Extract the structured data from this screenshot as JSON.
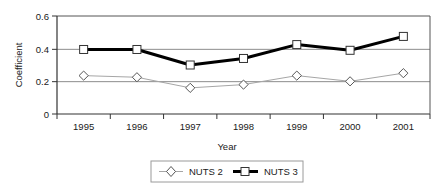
{
  "chart_data": {
    "type": "line",
    "title": "",
    "xlabel": "Year",
    "ylabel": "Coefficient",
    "categories": [
      "1995",
      "1996",
      "1997",
      "1998",
      "1999",
      "2000",
      "2001"
    ],
    "series": [
      {
        "name": "NUTS 2",
        "values": [
          0.235,
          0.225,
          0.16,
          0.18,
          0.235,
          0.2,
          0.25
        ],
        "color": "#a6a6a6",
        "marker": "diamond",
        "line_width": 1
      },
      {
        "name": "NUTS 3",
        "values": [
          0.395,
          0.395,
          0.3,
          0.34,
          0.425,
          0.39,
          0.475
        ],
        "color": "#000000",
        "marker": "square",
        "line_width": 3
      }
    ],
    "ylim": [
      0,
      0.6
    ],
    "yticks": [
      0,
      0.2,
      0.4,
      0.6
    ],
    "ytick_labels": [
      "0",
      "0.2",
      "0.4",
      "0.6"
    ],
    "grid": true,
    "gridlines_at": [
      0.2,
      0.4,
      0.6
    ],
    "grid_color": "#808080",
    "legend_position": "bottom-center",
    "axis_color": "#000000",
    "background": "#ffffff"
  },
  "legend": {
    "entries": [
      {
        "label": "NUTS 2",
        "marker": "diamond-icon"
      },
      {
        "label": "NUTS 3",
        "marker": "square-icon"
      }
    ]
  },
  "axes": {
    "y_title": "Coefficient",
    "x_title": "Year",
    "y_tick_0": "0",
    "y_tick_1": "0.2",
    "y_tick_2": "0.4",
    "y_tick_3": "0.6",
    "x_tick_0": "1995",
    "x_tick_1": "1996",
    "x_tick_2": "1997",
    "x_tick_3": "1998",
    "x_tick_4": "1999",
    "x_tick_5": "2000",
    "x_tick_6": "2001"
  }
}
